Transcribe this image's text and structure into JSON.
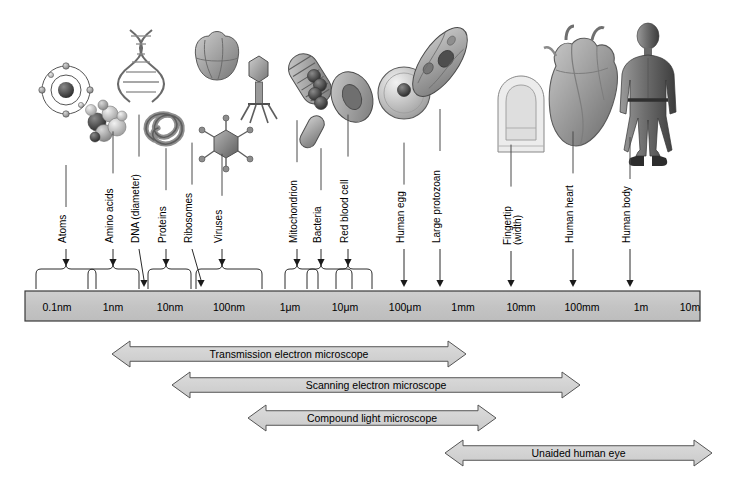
{
  "diagram": {
    "background_color": "#ffffff",
    "bar_fill": "#c6c6c6",
    "bar_stroke": "#3a3a3a",
    "arrow_fill": "#d2d2d2",
    "arrow_stroke": "#555555",
    "pointer_color": "#1a1a1a"
  },
  "scale_bar": {
    "name": "logarithmic-size-scale",
    "ticks": [
      {
        "label": "0.1nm",
        "x": 57
      },
      {
        "label": "1nm",
        "x": 113
      },
      {
        "label": "10nm",
        "x": 170
      },
      {
        "label": "100nm",
        "x": 229
      },
      {
        "label": "1μm",
        "x": 290
      },
      {
        "label": "10μm",
        "x": 345
      },
      {
        "label": "100μm",
        "x": 405
      },
      {
        "label": "1mm",
        "x": 463
      },
      {
        "label": "10mm",
        "x": 521
      },
      {
        "label": "100mm",
        "x": 582
      },
      {
        "label": "1m",
        "x": 641
      },
      {
        "label": "10m",
        "x": 690
      }
    ]
  },
  "specimens": [
    {
      "label": "Atoms",
      "icon": "atom-icon",
      "pointer": "brace",
      "label_x": 66,
      "label_y": 243,
      "arrow_x": 66,
      "brace_left": 36,
      "brace_right": 96
    },
    {
      "label": "Amino acids",
      "icon": "amino-acid-molecule-icon",
      "pointer": "brace",
      "label_x": 113,
      "label_y": 243,
      "arrow_x": 113,
      "brace_left": 88,
      "brace_right": 139
    },
    {
      "label": "DNA (diameter)",
      "icon": "dna-helix-icon",
      "pointer": "line",
      "label_x": 139,
      "label_y": 243,
      "arrow_x": 144
    },
    {
      "label": "Proteins",
      "icon": "protein-ribbon-icon",
      "pointer": "brace",
      "label_x": 166,
      "label_y": 243,
      "arrow_x": 166,
      "brace_left": 148,
      "brace_right": 191
    },
    {
      "label": "Ribosomes",
      "icon": "ribosome-icon",
      "pointer": "line",
      "label_x": 192,
      "label_y": 243,
      "arrow_x": 201
    },
    {
      "label": "Viruses",
      "icon": "virus-icon",
      "pointer": "brace",
      "label_x": 222,
      "label_y": 243,
      "arrow_x": 222,
      "brace_left": 196,
      "brace_right": 262
    },
    {
      "label": "Mitochondrion",
      "icon": "mitochondrion-icon",
      "pointer": "brace",
      "label_x": 297,
      "label_y": 243,
      "arrow_x": 297,
      "brace_left": 285,
      "brace_right": 318
    },
    {
      "label": "Bacteria",
      "icon": "bacteria-icon",
      "pointer": "brace",
      "label_x": 321,
      "label_y": 243,
      "arrow_x": 321,
      "brace_left": 307,
      "brace_right": 352
    },
    {
      "label": "Red blood cell",
      "icon": "red-blood-cell-icon",
      "pointer": "brace",
      "label_x": 348,
      "label_y": 243,
      "arrow_x": 348,
      "brace_left": 336,
      "brace_right": 372
    },
    {
      "label": "Human egg",
      "icon": "human-egg-icon",
      "pointer": "line",
      "label_x": 404,
      "label_y": 243,
      "arrow_x": 404
    },
    {
      "label": "Large protozoan",
      "icon": "protozoan-icon",
      "pointer": "line",
      "label_x": 440,
      "label_y": 243,
      "arrow_x": 440
    },
    {
      "label": "Fingertip",
      "label2": "(width)",
      "icon": "fingertip-icon",
      "pointer": "line",
      "label_x": 511,
      "label_y": 245,
      "arrow_x": 511
    },
    {
      "label": "Human heart",
      "icon": "heart-icon",
      "pointer": "line",
      "label_x": 573,
      "label_y": 243,
      "arrow_x": 573
    },
    {
      "label": "Human body",
      "icon": "human-body-icon",
      "pointer": "line",
      "label_x": 630,
      "label_y": 243,
      "arrow_x": 630
    }
  ],
  "instrument_ranges": [
    {
      "label": "Transmission electron microscope",
      "name": "transmission-electron-microscope-range",
      "x1": 112,
      "x2": 466,
      "y": 341,
      "height": 26,
      "left_head": true,
      "right_head": true
    },
    {
      "label": "Scanning electron microscope",
      "name": "scanning-electron-microscope-range",
      "x1": 172,
      "x2": 580,
      "y": 372,
      "height": 26,
      "left_head": true,
      "right_head": true
    },
    {
      "label": "Compound light microscope",
      "name": "compound-light-microscope-range",
      "x1": 248,
      "x2": 496,
      "y": 405,
      "height": 26,
      "left_head": true,
      "right_head": true
    },
    {
      "label": "Unaided human eye",
      "name": "unaided-human-eye-range",
      "x1": 445,
      "x2": 712,
      "y": 440,
      "height": 26,
      "left_head": true,
      "right_head": true
    }
  ]
}
